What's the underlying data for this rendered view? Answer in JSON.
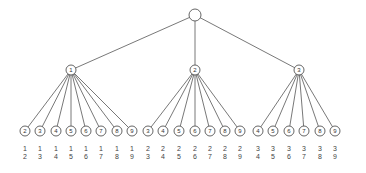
{
  "diagram": {
    "type": "tree",
    "root": {
      "label": "",
      "x": 195,
      "y": 15,
      "r": 6
    },
    "level1": [
      {
        "label": "1",
        "x": 71,
        "y": 70
      },
      {
        "label": "2",
        "x": 195,
        "y": 70
      },
      {
        "label": "3",
        "x": 299,
        "y": 70
      }
    ],
    "leaves": [
      {
        "parent": 0,
        "label": "2",
        "x": 25,
        "pair": [
          "1",
          "2"
        ]
      },
      {
        "parent": 0,
        "label": "3",
        "x": 40,
        "pair": [
          "1",
          "3"
        ]
      },
      {
        "parent": 0,
        "label": "4",
        "x": 56,
        "pair": [
          "1",
          "4"
        ]
      },
      {
        "parent": 0,
        "label": "5",
        "x": 71,
        "pair": [
          "1",
          "5"
        ]
      },
      {
        "parent": 0,
        "label": "6",
        "x": 86,
        "pair": [
          "1",
          "6"
        ]
      },
      {
        "parent": 0,
        "label": "7",
        "x": 101,
        "pair": [
          "1",
          "7"
        ]
      },
      {
        "parent": 0,
        "label": "8",
        "x": 117,
        "pair": [
          "1",
          "8"
        ]
      },
      {
        "parent": 0,
        "label": "9",
        "x": 132,
        "pair": [
          "1",
          "9"
        ]
      },
      {
        "parent": 1,
        "label": "3",
        "x": 148,
        "pair": [
          "2",
          "3"
        ]
      },
      {
        "parent": 1,
        "label": "4",
        "x": 163,
        "pair": [
          "2",
          "4"
        ]
      },
      {
        "parent": 1,
        "label": "5",
        "x": 179,
        "pair": [
          "2",
          "5"
        ]
      },
      {
        "parent": 1,
        "label": "6",
        "x": 195,
        "pair": [
          "2",
          "6"
        ]
      },
      {
        "parent": 1,
        "label": "7",
        "x": 210,
        "pair": [
          "2",
          "7"
        ]
      },
      {
        "parent": 1,
        "label": "8",
        "x": 225,
        "pair": [
          "2",
          "8"
        ]
      },
      {
        "parent": 1,
        "label": "9",
        "x": 240,
        "pair": [
          "2",
          "9"
        ]
      },
      {
        "parent": 2,
        "label": "4",
        "x": 258,
        "pair": [
          "3",
          "4"
        ]
      },
      {
        "parent": 2,
        "label": "5",
        "x": 273,
        "pair": [
          "3",
          "5"
        ]
      },
      {
        "parent": 2,
        "label": "6",
        "x": 289,
        "pair": [
          "3",
          "6"
        ]
      },
      {
        "parent": 2,
        "label": "7",
        "x": 304,
        "pair": [
          "3",
          "7"
        ]
      },
      {
        "parent": 2,
        "label": "8",
        "x": 320,
        "pair": [
          "3",
          "8"
        ]
      },
      {
        "parent": 2,
        "label": "9",
        "x": 335,
        "pair": [
          "3",
          "9"
        ]
      }
    ],
    "leaf_y": 131,
    "node_r": 5,
    "pair_y1": 151,
    "pair_y2": 159
  }
}
